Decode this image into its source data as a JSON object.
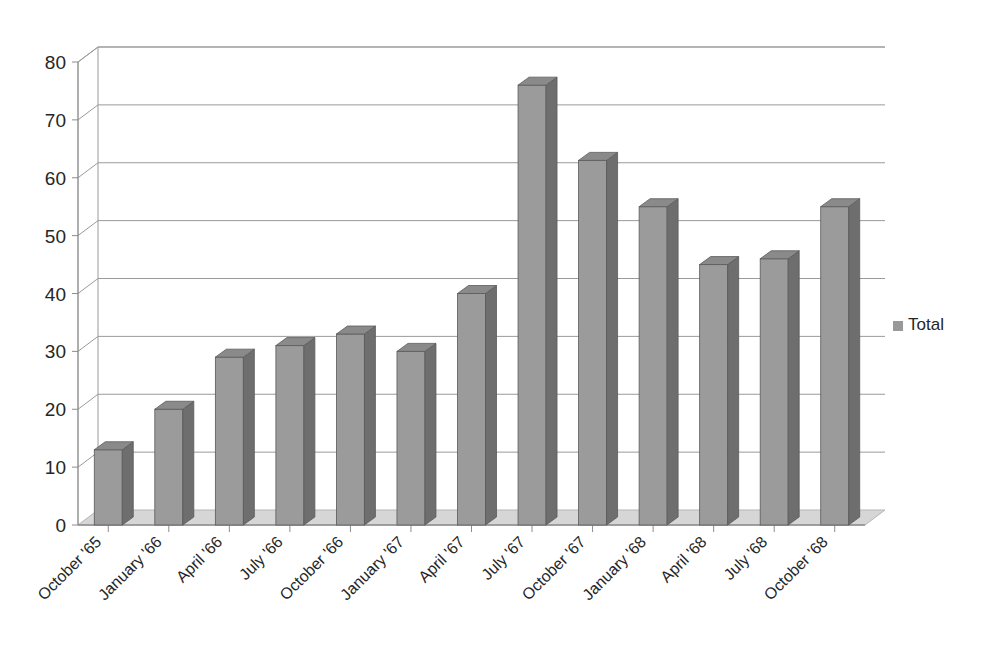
{
  "chart_data": {
    "type": "bar",
    "title": "",
    "subtitle": "",
    "xlabel": "",
    "ylabel": "",
    "ylim": [
      0,
      80
    ],
    "ytick_step": 10,
    "yticks": [
      "0",
      "10",
      "20",
      "30",
      "40",
      "50",
      "60",
      "70",
      "80"
    ],
    "grid": true,
    "style": "3d-column",
    "legend": {
      "position": "right",
      "entries": [
        {
          "name": "Total",
          "marker": "square",
          "color": "#999999"
        }
      ]
    },
    "categories": [
      "October '65",
      "January '66",
      "April '66",
      "July '66",
      "October '66",
      "January '67",
      "April '67",
      "July '67",
      "October '67",
      "January '68",
      "April '68",
      "July '68",
      "October '68"
    ],
    "series": [
      {
        "name": "Total",
        "values": [
          13,
          20,
          29,
          31,
          33,
          30,
          40,
          76,
          63,
          55,
          45,
          46,
          55
        ]
      }
    ]
  },
  "colors": {
    "bar_front": "#9b9b9b",
    "bar_side": "#6e6e6e",
    "bar_top": "#8a8a8a",
    "bar_outline": "#5a5a5a",
    "gridline": "#9a9a9a",
    "axis": "#8c8c8c",
    "floor": "#d6d6d6",
    "floor_edge": "#b5b5b5",
    "background": "#ffffff",
    "text": "#262626"
  },
  "legend": {
    "total_label": "Total"
  }
}
